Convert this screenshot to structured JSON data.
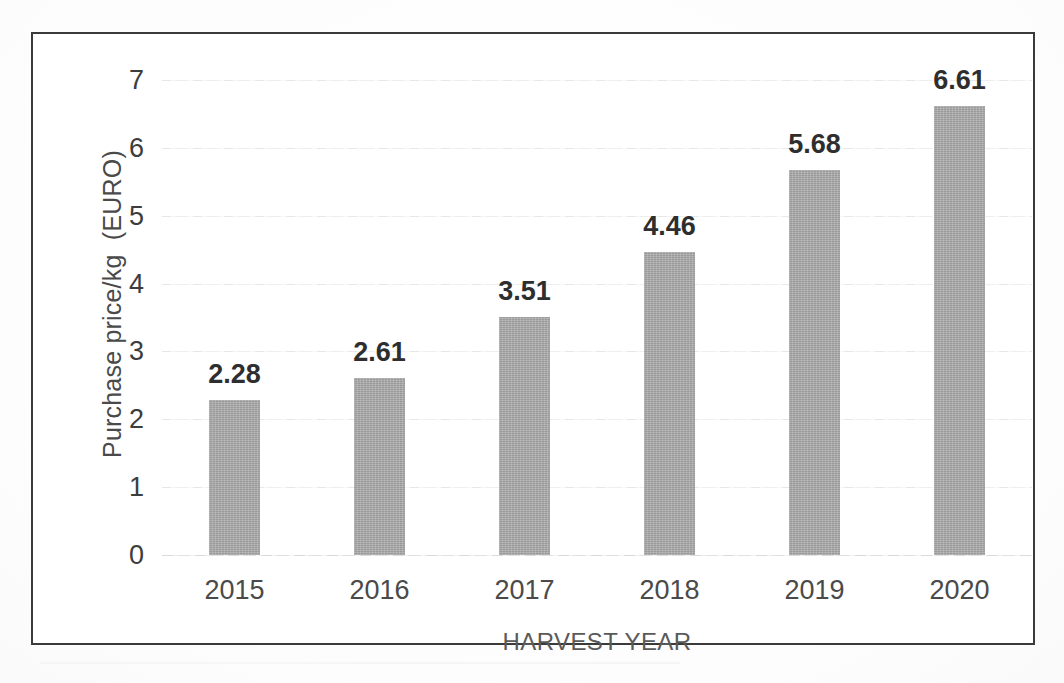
{
  "chart_data": {
    "type": "bar",
    "title": "",
    "subtitle": "",
    "xlabel": "HARVEST YEAR",
    "ylabel": "Purchase price/kg  (EURO)",
    "categories": [
      "2015",
      "2016",
      "2017",
      "2018",
      "2019",
      "2020"
    ],
    "values": [
      2.28,
      2.61,
      3.51,
      4.46,
      5.68,
      6.61
    ],
    "value_labels": [
      "2.28",
      "2.61",
      "3.51",
      "4.46",
      "5.68",
      "6.61"
    ],
    "series": [
      {
        "name": "Purchase price/kg (EURO)",
        "values": [
          2.28,
          2.61,
          3.51,
          4.46,
          5.68,
          6.61
        ]
      }
    ],
    "ylim": [
      0,
      7
    ],
    "ytick_labels": [
      "0",
      "1",
      "2",
      "3",
      "4",
      "5",
      "6",
      "7"
    ],
    "ytick_values": [
      0,
      1,
      2,
      3,
      4,
      5,
      6,
      7
    ],
    "grid": true,
    "grid_axis": "y",
    "legend": false,
    "legend_position": "none",
    "data_labels": true,
    "bar_color": "#a9a9a9",
    "border_color": "#3a3a3a",
    "gridline_color": "#e6e6e6",
    "text_color": "#3d3d3d"
  }
}
